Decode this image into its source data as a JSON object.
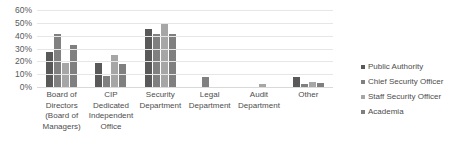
{
  "chart_data": {
    "type": "bar",
    "title": "",
    "subtitle": "",
    "xlabel": "",
    "ylabel": "",
    "ylim": [
      0,
      60
    ],
    "y_tick_labels": [
      "60%",
      "50%",
      "40%",
      "30%",
      "20%",
      "10%",
      "0%"
    ],
    "y_tick_values": [
      60,
      50,
      40,
      30,
      20,
      10,
      0
    ],
    "grid": true,
    "legend_position": "right",
    "categories": [
      "Board of Directors (Board of Managers)",
      "CIP Dedicated Independent Office",
      "Security Department",
      "Legal Department",
      "Audit Department",
      "Other"
    ],
    "category_lines": [
      [
        "Board of",
        "Directors",
        "(Board of",
        "Managers)"
      ],
      [
        "CIP",
        "Dedicated",
        "Independent",
        "Office"
      ],
      [
        "Security",
        "Department"
      ],
      [
        "Legal",
        "Department"
      ],
      [
        "Audit",
        "Department"
      ],
      [
        "Other"
      ]
    ],
    "series": [
      {
        "name": "Public Authority",
        "color": "#595959",
        "values": [
          27,
          18.5,
          45,
          0,
          0,
          8
        ]
      },
      {
        "name": "Chief Security Officer",
        "color": "#808080",
        "values": [
          41,
          8.5,
          41,
          8,
          0,
          2
        ]
      },
      {
        "name": "Staff Security Officer",
        "color": "#a6a6a6",
        "values": [
          19,
          25,
          50,
          0,
          2.5,
          4
        ]
      },
      {
        "name": "Academia",
        "color": "#7f7f7f",
        "values": [
          33,
          18,
          41,
          0,
          0,
          3
        ]
      }
    ]
  }
}
